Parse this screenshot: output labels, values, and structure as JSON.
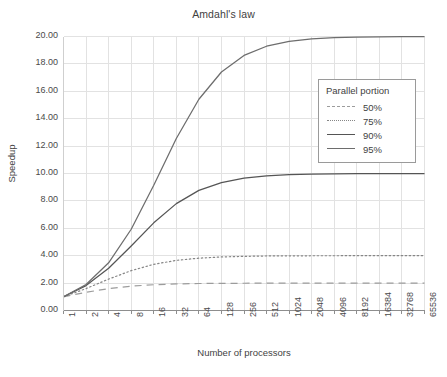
{
  "chart_data": {
    "type": "line",
    "title": "Amdahl's law",
    "xlabel": "Number of processors",
    "ylabel": "Speedup",
    "grid": true,
    "legend_position": "center-right",
    "legend_title": "Parallel portion",
    "x_scale": "log2",
    "x": [
      1,
      2,
      4,
      8,
      16,
      32,
      64,
      128,
      256,
      512,
      1024,
      2048,
      4096,
      8192,
      16384,
      32768,
      65536
    ],
    "xtick_labels": [
      "1",
      "2",
      "4",
      "8",
      "16",
      "32",
      "64",
      "128",
      "256",
      "512",
      "1024",
      "2048",
      "4096",
      "8192",
      "16384",
      "32768",
      "65536"
    ],
    "ytick_labels": [
      "0.00",
      "2.00",
      "4.00",
      "6.00",
      "8.00",
      "10.00",
      "12.00",
      "14.00",
      "16.00",
      "18.00",
      "20.00"
    ],
    "ylim": [
      0,
      20
    ],
    "ytick_step": 2,
    "series": [
      {
        "name": "50%",
        "parallel_fraction": 0.5,
        "style": "dashed",
        "color": "#9c9c9c",
        "values": [
          1.0,
          1.33,
          1.6,
          1.78,
          1.88,
          1.94,
          1.97,
          1.98,
          1.99,
          1.996,
          1.998,
          1.999,
          1.9995,
          1.9998,
          1.9999,
          1.99994,
          1.99997
        ]
      },
      {
        "name": "75%",
        "parallel_fraction": 0.75,
        "style": "dotted",
        "color": "#868686",
        "values": [
          1.0,
          1.6,
          2.29,
          2.91,
          3.37,
          3.66,
          3.82,
          3.91,
          3.95,
          3.98,
          3.99,
          3.995,
          3.998,
          3.999,
          3.9995,
          3.9997,
          3.9999
        ]
      },
      {
        "name": "90%",
        "parallel_fraction": 0.9,
        "style": "solid",
        "color": "#555555",
        "values": [
          1.0,
          1.82,
          3.08,
          4.71,
          6.4,
          7.8,
          8.77,
          9.34,
          9.66,
          9.83,
          9.91,
          9.96,
          9.98,
          9.99,
          9.995,
          9.997,
          9.999
        ]
      },
      {
        "name": "95%",
        "parallel_fraction": 0.95,
        "style": "solid",
        "color": "#6d6d6d",
        "values": [
          1.0,
          1.9,
          3.48,
          5.93,
          9.14,
          12.55,
          15.42,
          17.41,
          18.62,
          19.29,
          19.64,
          19.82,
          19.91,
          19.95,
          19.98,
          19.99,
          19.995
        ]
      }
    ]
  }
}
